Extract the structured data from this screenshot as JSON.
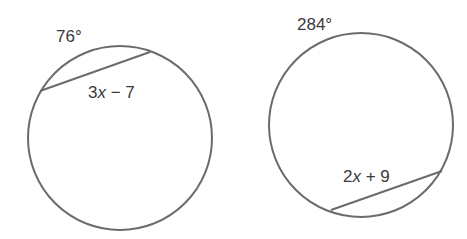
{
  "figures": [
    {
      "id": "left",
      "circle": {
        "cx": 120,
        "cy": 138,
        "r": 92
      },
      "chord": {
        "x1": 40,
        "y1": 91,
        "x2": 150,
        "y2": 52
      },
      "arc_label": {
        "text": "76°",
        "x": 56,
        "y": 28
      },
      "chord_label": {
        "coef": "3",
        "var": "x",
        "rest": " − 7",
        "x": 88,
        "y": 84
      }
    },
    {
      "id": "right",
      "circle": {
        "cx": 361,
        "cy": 125,
        "r": 92
      },
      "chord": {
        "x1": 331,
        "y1": 210,
        "x2": 442,
        "y2": 171
      },
      "arc_label": {
        "text": "284°",
        "x": 297,
        "y": 16
      },
      "chord_label": {
        "coef": "2",
        "var": "x",
        "rest": " + 9",
        "x": 343,
        "y": 168
      }
    }
  ],
  "style": {
    "stroke": "#6b6b6b",
    "stroke_width": 2,
    "text_color": "#3a3a3a"
  }
}
